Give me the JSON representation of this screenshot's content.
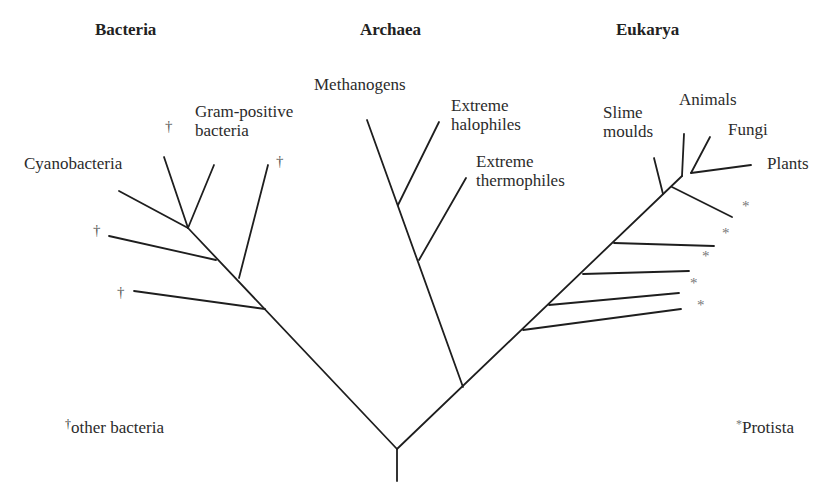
{
  "domains": [
    {
      "label": "Bacteria",
      "x": 95,
      "y": 20
    },
    {
      "label": "Archaea",
      "x": 360,
      "y": 20
    },
    {
      "label": "Eukarya",
      "x": 616,
      "y": 20
    }
  ],
  "labels": [
    {
      "id": "cyanobacteria",
      "text": "Cyanobacteria",
      "x": 24,
      "y": 168
    },
    {
      "id": "gram-positive",
      "text": "Gram-positive\nbacteria",
      "x": 195,
      "y": 116
    },
    {
      "id": "methanogens",
      "text": "Methanogens",
      "x": 314,
      "y": 89
    },
    {
      "id": "extreme-halophiles",
      "text": "Extreme\nhalophiles",
      "x": 451,
      "y": 110
    },
    {
      "id": "extreme-thermophiles",
      "text": "Extreme\nthermophiles",
      "x": 476,
      "y": 166
    },
    {
      "id": "slime-moulds",
      "text": "Slime\nmoulds",
      "x": 603,
      "y": 117
    },
    {
      "id": "animals",
      "text": "Animals",
      "x": 679,
      "y": 104
    },
    {
      "id": "fungi",
      "text": "Fungi",
      "x": 728,
      "y": 134
    },
    {
      "id": "plants",
      "text": "Plants",
      "x": 767,
      "y": 168
    }
  ],
  "daggers": [
    {
      "x": 165,
      "y": 130
    },
    {
      "x": 276,
      "y": 165
    },
    {
      "x": 93,
      "y": 234
    },
    {
      "x": 117,
      "y": 296
    }
  ],
  "stars": [
    {
      "x": 742,
      "y": 208
    },
    {
      "x": 722,
      "y": 235
    },
    {
      "x": 702,
      "y": 258
    },
    {
      "x": 690,
      "y": 285
    },
    {
      "x": 697,
      "y": 307
    }
  ],
  "branches": [
    [
      397,
      481,
      397,
      449
    ],
    [
      397,
      449,
      188,
      228
    ],
    [
      188,
      228,
      119,
      191
    ],
    [
      188,
      228,
      164,
      157
    ],
    [
      188,
      228,
      214,
      165
    ],
    [
      216,
      260,
      109,
      236
    ],
    [
      239,
      278,
      268,
      165
    ],
    [
      265,
      309,
      134,
      291
    ],
    [
      397,
      449,
      682,
      176
    ],
    [
      463,
      387,
      367,
      120
    ],
    [
      398,
      205,
      439,
      122
    ],
    [
      419,
      260,
      466,
      178
    ],
    [
      663,
      194,
      654,
      158
    ],
    [
      682,
      176,
      684,
      134
    ],
    [
      691,
      173,
      710,
      137
    ],
    [
      691,
      173,
      751,
      165
    ],
    [
      672,
      187,
      732,
      217
    ],
    [
      614,
      243,
      714,
      246
    ],
    [
      583,
      274,
      689,
      271
    ],
    [
      549,
      305,
      679,
      293
    ],
    [
      523,
      330,
      681,
      309
    ]
  ],
  "legend": {
    "bacteria_mark": "†",
    "bacteria_text": "other bacteria",
    "protista_mark": "*",
    "protista_text": "Protista"
  }
}
